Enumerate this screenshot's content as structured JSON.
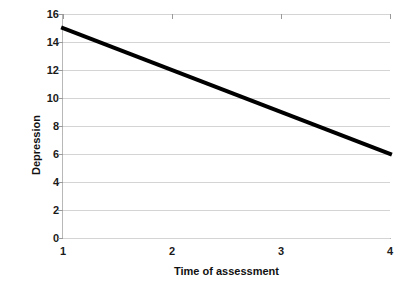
{
  "chart_data": {
    "type": "line",
    "title": "",
    "xlabel": "Time of assessment",
    "ylabel": "Depression",
    "x": [
      1,
      4
    ],
    "xlim": [
      1,
      4
    ],
    "ylim": [
      0,
      16
    ],
    "xticks": [
      "1",
      "2",
      "3",
      "4"
    ],
    "yticks": [
      "0",
      "2",
      "4",
      "6",
      "8",
      "10",
      "12",
      "14",
      "16"
    ],
    "grid": "horizontal",
    "legend": "none",
    "series": [
      {
        "name": "Depression",
        "x": [
          1,
          4
        ],
        "values": [
          15,
          6
        ],
        "color": "#000000",
        "line_width": 4
      }
    ],
    "colors": {
      "line": "#000000",
      "gridline": "#d4d4d4",
      "axis": "#b8b8b8",
      "tick_mark": "#9a9a9a",
      "text": "#111111",
      "background": "#ffffff"
    }
  }
}
